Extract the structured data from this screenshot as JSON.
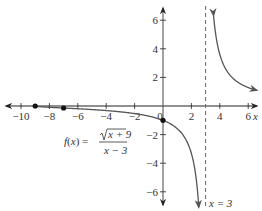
{
  "chart_data": {
    "type": "line",
    "title": "",
    "function_label": {
      "lhs": "f(x) =",
      "numerator": "x + 9",
      "numerator_has_sqrt": true,
      "denominator": "x − 3"
    },
    "asymptote_label": "x = 3",
    "xlabel": "x",
    "ylabel": "",
    "xlim": [
      -10.5,
      7
    ],
    "ylim": [
      -7,
      7
    ],
    "x_ticks": [
      -10,
      -8,
      -6,
      -4,
      -2,
      0,
      2,
      4,
      6
    ],
    "x_tick_labels": [
      "−10",
      "−8",
      "−6",
      "−4",
      "−2",
      "0",
      "2",
      "4",
      "6"
    ],
    "y_ticks": [
      -6,
      -4,
      -2,
      2,
      4,
      6
    ],
    "y_tick_labels": [
      "−6",
      "−4",
      "−2",
      "2",
      "4",
      "6"
    ],
    "grid": false,
    "series": [
      {
        "name": "f(x) = sqrt(x+9)/(x-3), left branch",
        "domain": [
          -9,
          3
        ],
        "x": [
          -9,
          -8,
          -7,
          -6,
          -5,
          -4,
          -3,
          -2,
          -1,
          0,
          1,
          1.5,
          2,
          2.3,
          2.5
        ],
        "values": [
          0,
          -0.091,
          -0.141,
          -0.192,
          -0.25,
          -0.316,
          -0.408,
          -0.529,
          -0.707,
          -1,
          -1.581,
          -2.16,
          -3.317,
          -4.704,
          -6.633
        ]
      },
      {
        "name": "f(x) = sqrt(x+9)/(x-3), right branch",
        "domain": [
          3,
          6.5
        ],
        "x": [
          3.55,
          3.75,
          4,
          4.5,
          5,
          5.5,
          6,
          6.5
        ],
        "values": [
          6.57,
          4.94,
          3.61,
          2.49,
          1.87,
          1.52,
          1.29,
          1.12
        ]
      }
    ],
    "highlighted_points": [
      {
        "x": -9,
        "y": 0
      },
      {
        "x": -7,
        "y": -0.141
      },
      {
        "x": 0,
        "y": -1
      }
    ],
    "vertical_asymptote": {
      "x": 3,
      "style": "dashed"
    },
    "horizontal_asymptote": {
      "y": 0
    }
  }
}
